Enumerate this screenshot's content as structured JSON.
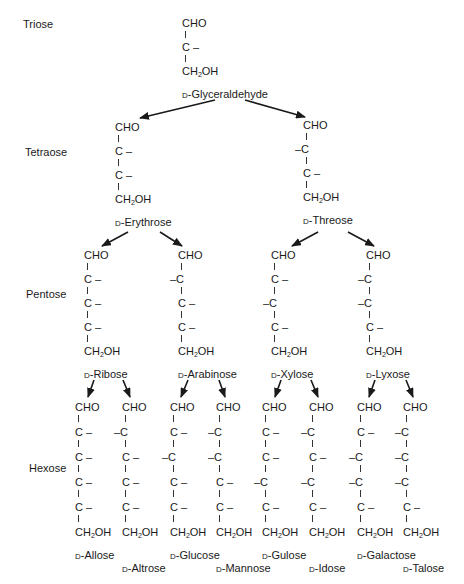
{
  "levels": {
    "triose": "Triose",
    "tetraose": "Tetraose",
    "pentose": "Pentose",
    "hexose": "Hexose"
  },
  "formula": {
    "aldehyde": "CHO",
    "terminal": "CH2OH"
  },
  "prefix": "D-",
  "molecules": [
    {
      "id": "glyceraldehyde",
      "name": "Glyceraldehyde",
      "level": "triose",
      "x": 182,
      "y": 18,
      "oh": [
        "R"
      ]
    },
    {
      "id": "erythrose",
      "name": "Erythrose",
      "level": "tetraose",
      "x": 115,
      "y": 122,
      "oh": [
        "R",
        "R"
      ]
    },
    {
      "id": "threose",
      "name": "Threose",
      "level": "tetraose",
      "x": 303,
      "y": 120,
      "oh": [
        "L",
        "R"
      ]
    },
    {
      "id": "ribose",
      "name": "Ribose",
      "level": "pentose",
      "x": 84,
      "y": 250,
      "oh": [
        "R",
        "R",
        "R"
      ]
    },
    {
      "id": "arabinose",
      "name": "Arabinose",
      "level": "pentose",
      "x": 178,
      "y": 250,
      "oh": [
        "L",
        "R",
        "R"
      ]
    },
    {
      "id": "xylose",
      "name": "Xylose",
      "level": "pentose",
      "x": 271,
      "y": 250,
      "oh": [
        "R",
        "L",
        "R"
      ]
    },
    {
      "id": "lyxose",
      "name": "Lyxose",
      "level": "pentose",
      "x": 366,
      "y": 250,
      "oh": [
        "L",
        "L",
        "R"
      ]
    },
    {
      "id": "allose",
      "name": "Allose",
      "level": "hexose",
      "x": 75,
      "y": 402,
      "oh": [
        "R",
        "R",
        "R",
        "R"
      ],
      "nameDy": 0
    },
    {
      "id": "altrose",
      "name": "Altrose",
      "level": "hexose",
      "x": 122,
      "y": 402,
      "oh": [
        "L",
        "R",
        "R",
        "R"
      ],
      "nameDy": 13
    },
    {
      "id": "glucose",
      "name": "Glucose",
      "level": "hexose",
      "x": 170,
      "y": 402,
      "oh": [
        "R",
        "L",
        "R",
        "R"
      ],
      "nameDy": 0
    },
    {
      "id": "mannose",
      "name": "Mannose",
      "level": "hexose",
      "x": 216,
      "y": 402,
      "oh": [
        "L",
        "L",
        "R",
        "R"
      ],
      "nameDy": 13
    },
    {
      "id": "gulose",
      "name": "Gulose",
      "level": "hexose",
      "x": 262,
      "y": 402,
      "oh": [
        "R",
        "R",
        "L",
        "R"
      ],
      "nameDy": 0
    },
    {
      "id": "idose",
      "name": "Idose",
      "level": "hexose",
      "x": 309,
      "y": 402,
      "oh": [
        "L",
        "R",
        "L",
        "R"
      ],
      "nameDy": 13
    },
    {
      "id": "galactose",
      "name": "Galactose",
      "level": "hexose",
      "x": 357,
      "y": 402,
      "oh": [
        "R",
        "L",
        "L",
        "R"
      ],
      "nameDy": 0
    },
    {
      "id": "talose",
      "name": "Talose",
      "level": "hexose",
      "x": 403,
      "y": 402,
      "oh": [
        "L",
        "L",
        "L",
        "R"
      ],
      "nameDy": 13
    }
  ],
  "arrows": [
    {
      "from": "glyceraldehyde",
      "to": "erythrose",
      "x1": 215,
      "y1": 100,
      "x2": 140,
      "y2": 118
    },
    {
      "from": "glyceraldehyde",
      "to": "threose",
      "x1": 245,
      "y1": 100,
      "x2": 305,
      "y2": 117
    },
    {
      "from": "erythrose",
      "to": "ribose",
      "x1": 128,
      "y1": 232,
      "x2": 102,
      "y2": 246
    },
    {
      "from": "erythrose",
      "to": "arabinose",
      "x1": 160,
      "y1": 232,
      "x2": 182,
      "y2": 246
    },
    {
      "from": "threose",
      "to": "xylose",
      "x1": 318,
      "y1": 232,
      "x2": 292,
      "y2": 246
    },
    {
      "from": "threose",
      "to": "lyxose",
      "x1": 348,
      "y1": 232,
      "x2": 374,
      "y2": 246
    },
    {
      "from": "ribose",
      "to": "allose",
      "x1": 94,
      "y1": 380,
      "x2": 88,
      "y2": 397
    },
    {
      "from": "ribose",
      "to": "altrose",
      "x1": 123,
      "y1": 380,
      "x2": 130,
      "y2": 397
    },
    {
      "from": "arabinose",
      "to": "glucose",
      "x1": 188,
      "y1": 380,
      "x2": 181,
      "y2": 397
    },
    {
      "from": "arabinose",
      "to": "mannose",
      "x1": 219,
      "y1": 380,
      "x2": 225,
      "y2": 397
    },
    {
      "from": "xylose",
      "to": "gulose",
      "x1": 281,
      "y1": 380,
      "x2": 275,
      "y2": 397
    },
    {
      "from": "xylose",
      "to": "idose",
      "x1": 311,
      "y1": 380,
      "x2": 318,
      "y2": 397
    },
    {
      "from": "lyxose",
      "to": "galactose",
      "x1": 375,
      "y1": 380,
      "x2": 369,
      "y2": 397
    },
    {
      "from": "lyxose",
      "to": "talose",
      "x1": 406,
      "y1": 380,
      "x2": 413,
      "y2": 397
    }
  ]
}
